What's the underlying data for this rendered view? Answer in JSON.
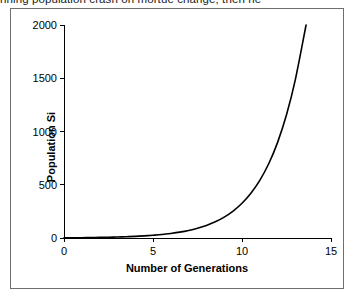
{
  "document": {
    "title_clipped": "nning population crash on mortue change; then ne"
  },
  "chart_data": {
    "type": "line",
    "title": "",
    "xlabel": "Number of Generations",
    "ylabel": "Population Si",
    "ylabel_clipped": true,
    "xlim": [
      0,
      15
    ],
    "ylim": [
      0,
      2000
    ],
    "grid": false,
    "legend": "none",
    "xticks": [
      0,
      5,
      10,
      15
    ],
    "xtick_labels": [
      "0",
      "5",
      "10",
      "15"
    ],
    "yticks": [
      0,
      500,
      1000,
      1500,
      2000
    ],
    "ytick_labels": [
      "0",
      "500",
      "1000",
      "1500",
      "2000"
    ],
    "series": [
      {
        "name": "Population size",
        "x": [
          0,
          0.5,
          1,
          1.5,
          2,
          2.5,
          3,
          3.5,
          4,
          4.5,
          5,
          5.5,
          6,
          6.5,
          7,
          7.5,
          8,
          8.5,
          9,
          9.5,
          10,
          10.5,
          11,
          11.5,
          12,
          12.5,
          13,
          13.6
        ],
        "values": [
          2,
          3,
          3,
          4,
          6,
          7,
          9,
          12,
          15,
          20,
          26,
          33,
          43,
          55,
          71,
          92,
          118,
          152,
          196,
          253,
          326,
          420,
          541,
          697,
          898,
          1157,
          1490,
          2000
        ]
      }
    ]
  },
  "axis_colors": {
    "axis": "#000000",
    "curve": "#000000",
    "frame": "#6e6e6e",
    "background": "#ffffff"
  }
}
